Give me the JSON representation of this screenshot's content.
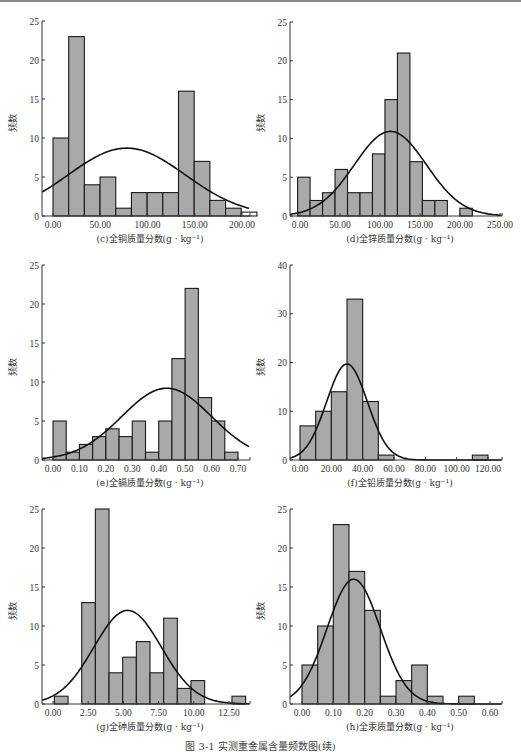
{
  "figure": {
    "caption": "图 3-1  实测重金属含量频数图(续)",
    "ylabel": "频数"
  },
  "chart_data": [
    {
      "id": "c",
      "type": "bar",
      "title": "(c)全铜质量分数(g · kg⁻¹)",
      "xlabel": "(c)全铜质量分数(g · kg⁻¹)",
      "ylabel": "频数",
      "xticks": [
        "0.00",
        "50.00",
        "100.00",
        "150.00",
        "200.00"
      ],
      "xtick_values": [
        0,
        50,
        100,
        150,
        200
      ],
      "yticks": [
        0,
        5,
        10,
        15,
        20,
        25
      ],
      "ylim": [
        0,
        25
      ],
      "xlim": [
        -12,
        213
      ],
      "bin_start": 0,
      "bin_width": 16.6,
      "values": [
        10,
        23,
        4,
        5,
        1,
        3,
        3,
        3,
        16,
        7,
        2,
        1,
        0.5
      ],
      "normal_curve": {
        "mean": 78,
        "sd": 62,
        "peak": 8.7
      },
      "grid": false
    },
    {
      "id": "d",
      "type": "bar",
      "title": "(d)全锌质量分数(g · kg⁻¹)",
      "xlabel": "(d)全锌质量分数(g · kg⁻¹)",
      "ylabel": "频数",
      "xticks": [
        "0.00",
        "50.00",
        "100.00",
        "150.00",
        "200.00",
        "250.00"
      ],
      "xtick_values": [
        0,
        50,
        100,
        150,
        200,
        250
      ],
      "yticks": [
        0,
        5,
        10,
        15,
        20,
        25
      ],
      "ylim": [
        0,
        25
      ],
      "xlim": [
        -12,
        255
      ],
      "bin_start": -3,
      "bin_width": 15.6,
      "values": [
        5,
        2,
        3,
        6,
        3,
        3,
        8,
        15,
        21,
        7,
        2,
        2,
        0,
        1
      ],
      "normal_curve": {
        "mean": 113,
        "sd": 45,
        "peak": 10.9
      },
      "grid": false
    },
    {
      "id": "e",
      "type": "bar",
      "title": "(e)全镉质量分数(g · kg⁻¹)",
      "xlabel": "(e)全镉质量分数(g · kg⁻¹)",
      "ylabel": "频数",
      "xticks": [
        "0.00",
        "0.10",
        "0.20",
        "0.30",
        "0.40",
        "0.50",
        "0.60",
        "0.70"
      ],
      "xtick_values": [
        0,
        0.1,
        0.2,
        0.3,
        0.4,
        0.5,
        0.6,
        0.7
      ],
      "yticks": [
        0,
        5,
        10,
        15,
        20,
        25
      ],
      "ylim": [
        0,
        25
      ],
      "xlim": [
        -0.04,
        0.75
      ],
      "bin_start": 0,
      "bin_width": 0.05,
      "values": [
        5,
        1,
        2,
        3,
        4,
        3,
        5,
        1,
        5,
        13,
        22,
        8,
        5,
        1
      ],
      "normal_curve": {
        "mean": 0.43,
        "sd": 0.17,
        "peak": 9.2
      },
      "grid": false
    },
    {
      "id": "f",
      "type": "bar",
      "title": "(f)全铅质量分数(g · kg⁻¹)",
      "xlabel": "(f)全铅质量分数(g · kg⁻¹)",
      "ylabel": "频数",
      "xticks": [
        "0.00",
        "20.00",
        "40.00",
        "60.00",
        "80.00",
        "100.00",
        "120.00"
      ],
      "xtick_values": [
        0,
        20,
        40,
        60,
        80,
        100,
        120
      ],
      "yticks": [
        0,
        10,
        20,
        30,
        40
      ],
      "ylim": [
        0,
        40
      ],
      "xlim": [
        -6,
        125
      ],
      "bin_start": 0,
      "bin_width": 10,
      "values": [
        7,
        10,
        14,
        33,
        12,
        1,
        0,
        0,
        0,
        0,
        0,
        1
      ],
      "normal_curve": {
        "mean": 30,
        "sd": 13,
        "peak": 19.7
      },
      "grid": false
    },
    {
      "id": "g",
      "type": "bar",
      "title": "(g)全砷质量分数(g · kg⁻¹)",
      "xlabel": "(g)全砷质量分数(g · kg⁻¹)",
      "ylabel": "频数",
      "xticks": [
        "0.00",
        "2.50",
        "5.00",
        "7.50",
        "10.00",
        "12.50"
      ],
      "xtick_values": [
        0,
        2.5,
        5,
        7.5,
        10,
        12.5
      ],
      "yticks": [
        0,
        5,
        10,
        15,
        20,
        25
      ],
      "ylim": [
        0,
        25
      ],
      "xlim": [
        -0.8,
        14.8
      ],
      "bin_start": 0.1,
      "bin_width": 0.97,
      "values": [
        1,
        0,
        13,
        25,
        4,
        6,
        8,
        4,
        11,
        2,
        3,
        0,
        0,
        1
      ],
      "normal_curve": {
        "mean": 5.3,
        "sd": 2.4,
        "peak": 12
      },
      "grid": false
    },
    {
      "id": "h",
      "type": "bar",
      "title": "(h)全汞质量分数(g · kg⁻¹)",
      "xlabel": "(h)全汞质量分数(g · kg⁻¹)",
      "ylabel": "频数",
      "xticks": [
        "0.00",
        "0.10",
        "0.20",
        "0.30",
        "0.40",
        "0.50",
        "0.60"
      ],
      "xtick_values": [
        0,
        0.1,
        0.2,
        0.3,
        0.4,
        0.5,
        0.6
      ],
      "yticks": [
        0,
        5,
        10,
        15,
        20,
        25
      ],
      "ylim": [
        0,
        25
      ],
      "xlim": [
        -0.035,
        0.635
      ],
      "bin_start": 0,
      "bin_width": 0.05,
      "values": [
        5,
        10,
        23,
        17,
        12,
        1,
        3,
        5,
        1,
        0,
        1
      ],
      "normal_curve": {
        "mean": 0.165,
        "sd": 0.085,
        "peak": 16
      },
      "grid": false
    }
  ]
}
